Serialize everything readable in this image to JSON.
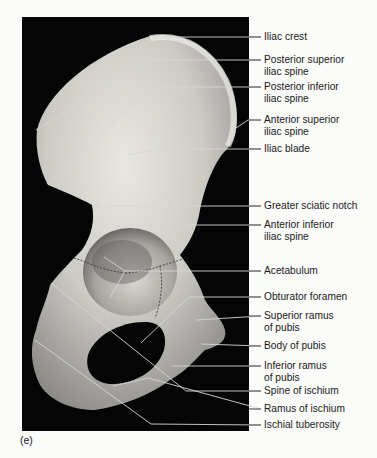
{
  "figure": {
    "panel_letter": "(e)",
    "labels": [
      {
        "text": "Iliac crest",
        "y": 31,
        "line_y": 37,
        "target": [
          152,
          37
        ]
      },
      {
        "text": "Posterior superior\niliac spine",
        "y": 54,
        "line_y": 60,
        "target": [
          150,
          60
        ],
        "bend": [
          36,
          130
        ]
      },
      {
        "text": "Posterior inferior\niliac spine",
        "y": 81,
        "line_y": 87,
        "target": [
          150,
          87
        ],
        "bend": [
          47,
          184
        ]
      },
      {
        "text": "Anterior superior\niliac spine",
        "y": 113,
        "line_y": 120,
        "target": [
          248,
          120
        ],
        "bend": [
          233,
          130
        ]
      },
      {
        "text": "Iliac blade",
        "y": 143,
        "line_y": 149,
        "target": [
          160,
          149
        ]
      },
      {
        "text": "Greater sciatic notch",
        "y": 200,
        "line_y": 206,
        "target": [
          92,
          206
        ]
      },
      {
        "text": "Anterior inferior\niliac spine",
        "y": 219,
        "line_y": 225,
        "target": [
          187,
          225
        ]
      },
      {
        "text": "Acetabulum",
        "y": 264,
        "line_y": 271,
        "target": [
          125,
          271
        ]
      },
      {
        "text": "Obturator foramen",
        "y": 291,
        "line_y": 297,
        "target": [
          189,
          297
        ],
        "bend": [
          141,
          343
        ]
      },
      {
        "text": "Superior ramus\nof pubis",
        "y": 309,
        "line_y": 316,
        "target": [
          196,
          320
        ]
      },
      {
        "text": "Body of pubis",
        "y": 340,
        "line_y": 346,
        "target": [
          201,
          344
        ]
      },
      {
        "text": "Inferior ramus\nof pubis",
        "y": 360,
        "line_y": 366,
        "target": [
          172,
          366
        ]
      },
      {
        "text": "Spine of ischium",
        "y": 385,
        "line_y": 391,
        "target": [
          186,
          391
        ],
        "bend": [
          51,
          283
        ]
      },
      {
        "text": "Ramus of ischium",
        "y": 403,
        "line_y": 409,
        "target": [
          148,
          378
        ],
        "bend": [
          113,
          386
        ]
      },
      {
        "text": "Ischial tuberosity",
        "y": 419,
        "line_y": 425,
        "target": [
          151,
          424
        ],
        "bend": [
          35,
          340
        ]
      }
    ],
    "colors": {
      "background": "#fbfbfa",
      "photo_background": "#050505",
      "bone": "#cfcdc8",
      "bone_shadow": "#8f8d88",
      "leader_line": "#d8d8d8",
      "label_text": "#1a1a1a"
    }
  }
}
